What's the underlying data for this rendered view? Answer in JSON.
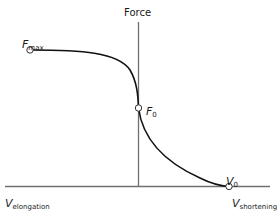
{
  "diagram": {
    "y_axis_label": "Force",
    "points": {
      "fmax": {
        "symbol": "F",
        "subscript": "max"
      },
      "f0": {
        "symbol": "F",
        "subscript": "0"
      },
      "v0": {
        "symbol": "V",
        "subscript": "0"
      }
    },
    "x_axis": {
      "left_label": {
        "symbol": "V",
        "subscript": "elongation"
      },
      "right_label": {
        "symbol": "V",
        "subscript": "shortening"
      }
    },
    "colors": {
      "axis": "#707070",
      "curve": "#111111",
      "marker_fill": "#ffffff",
      "marker_stroke": "#333333"
    }
  }
}
